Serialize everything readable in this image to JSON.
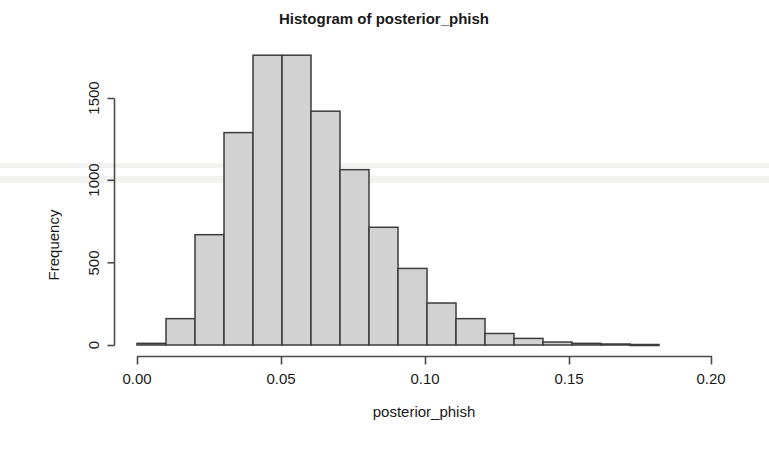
{
  "chart_data": {
    "type": "bar",
    "subtype": "histogram",
    "title": "Histogram of posterior_phish",
    "xlabel": "posterior_phish",
    "ylabel": "Frequency",
    "grid": false,
    "legend": null,
    "bin_width": 0.01,
    "xlim": [
      0.0,
      0.2
    ],
    "ylim": [
      0,
      1760
    ],
    "xticks": [
      0.0,
      0.05,
      0.1,
      0.15,
      0.2
    ],
    "xtick_labels": [
      "0.00",
      "0.05",
      "0.10",
      "0.15",
      "0.20"
    ],
    "yticks": [
      0,
      500,
      1000,
      1500
    ],
    "ytick_labels": [
      "0",
      "500",
      "1000",
      "1500"
    ],
    "bin_edges": [
      0.0,
      0.01,
      0.02,
      0.03,
      0.04,
      0.05,
      0.06,
      0.07,
      0.08,
      0.09,
      0.1,
      0.11,
      0.12,
      0.13,
      0.14,
      0.15,
      0.16,
      0.17,
      0.18
    ],
    "categories": [
      "0.00-0.01",
      "0.01-0.02",
      "0.02-0.03",
      "0.03-0.04",
      "0.04-0.05",
      "0.05-0.06",
      "0.06-0.07",
      "0.07-0.08",
      "0.08-0.09",
      "0.09-0.10",
      "0.10-0.11",
      "0.11-0.12",
      "0.12-0.13",
      "0.13-0.14",
      "0.14-0.15",
      "0.15-0.16",
      "0.16-0.17",
      "0.17-0.18"
    ],
    "values": [
      10,
      160,
      670,
      1290,
      1760,
      1760,
      1420,
      1065,
      715,
      465,
      255,
      160,
      70,
      40,
      18,
      10,
      6,
      3
    ],
    "bar_fill": "#d2d2d2",
    "bar_stroke": "#3c3c3c",
    "axis_color": "#4a4a4a",
    "text_color": "#1a1a1a",
    "background": "#ffffff"
  },
  "plot_geometry": {
    "x_pixel_at_0": 137,
    "x_pixels_per_unit": 2900,
    "y_pixel_at_0": 345,
    "y_pixels_per_count": 0.16466
  }
}
